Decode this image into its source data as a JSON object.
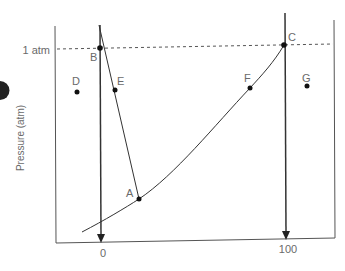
{
  "diagram": {
    "type": "phase-diagram",
    "y_axis_label": "Pressure (atm)",
    "pressure_reference_label": "1 atm",
    "x_ticks": [
      {
        "label": "0",
        "x": 101
      },
      {
        "label": "100",
        "x": 286
      }
    ],
    "points": [
      {
        "label": "A",
        "x": 139,
        "y": 199
      },
      {
        "label": "B",
        "x": 100,
        "y": 48
      },
      {
        "label": "C",
        "x": 284,
        "y": 45
      },
      {
        "label": "D",
        "x": 77,
        "y": 92
      },
      {
        "label": "E",
        "x": 115,
        "y": 90
      },
      {
        "label": "F",
        "x": 250,
        "y": 88
      },
      {
        "label": "G",
        "x": 307,
        "y": 86
      }
    ],
    "colors": {
      "lines": "#333333",
      "text": "#6a6a6a",
      "points": "#111111"
    }
  }
}
